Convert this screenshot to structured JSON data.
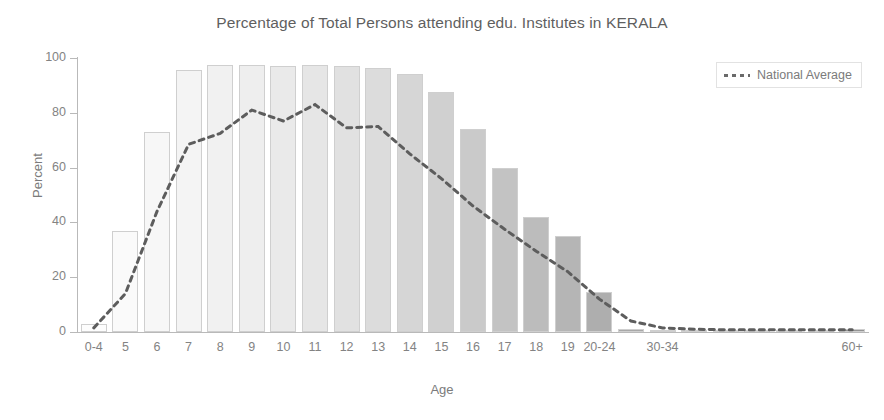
{
  "chart_data": {
    "type": "bar",
    "title": "Percentage of Total Persons attending edu. Institutes in KERALA",
    "xlabel": "Age",
    "ylabel": "Percent",
    "ylim": [
      0,
      100
    ],
    "xlim_note": "categorical age groups, left to right",
    "grid": false,
    "legend_position": "top-right",
    "ytick_labels": [
      "0",
      "20",
      "40",
      "60",
      "80",
      "100"
    ],
    "ytick_values": [
      0,
      20,
      40,
      60,
      80,
      100
    ],
    "categories": [
      "0-4",
      "5",
      "6",
      "7",
      "8",
      "9",
      "10",
      "11",
      "12",
      "13",
      "14",
      "15",
      "16",
      "17",
      "18",
      "19",
      "20-24",
      "25-29",
      "30-34",
      "35-39",
      "40-44",
      "45-49",
      "50-54",
      "55-59",
      "60+"
    ],
    "visible_xtick_labels": [
      "0-4",
      "5",
      "6",
      "7",
      "8",
      "9",
      "10",
      "11",
      "12",
      "13",
      "14",
      "15",
      "16",
      "17",
      "18",
      "19",
      "20-24",
      "",
      "30-34",
      "",
      "",
      "",
      "",
      "",
      "60+"
    ],
    "series": [
      {
        "name": "KERALA",
        "render": "bar",
        "values": [
          3,
          37,
          73,
          95.5,
          97.5,
          97.5,
          97,
          97.5,
          97,
          96.5,
          94,
          87.5,
          74,
          60,
          42,
          35,
          14.5,
          1.2,
          0.8,
          0.6,
          0.5,
          0.5,
          0.5,
          0.5,
          1.0
        ],
        "colors": [
          "#fdfdfd",
          "#fafafa",
          "#f7f7f7",
          "#f4f4f4",
          "#f1f1f1",
          "#eeeeee",
          "#eaeaea",
          "#e6e6e6",
          "#e1e1e1",
          "#dcdcdc",
          "#d6d6d6",
          "#d0d0d0",
          "#cacaca",
          "#c3c3c3",
          "#bcbcbc",
          "#b5b5b5",
          "#aeaeae",
          "#a8a8a8",
          "#a3a3a3",
          "#9f9f9f",
          "#9c9c9c",
          "#999999",
          "#979797",
          "#959595",
          "#939393"
        ],
        "border_color": "#cfcfcf"
      },
      {
        "name": "National Average",
        "render": "dashed-line",
        "color": "#5d5d5d",
        "values": [
          1.5,
          14,
          44,
          68.5,
          72.5,
          81,
          77,
          83,
          74.5,
          75,
          65,
          56,
          46,
          37.5,
          29.5,
          22,
          12,
          4,
          1.5,
          1,
          0.8,
          0.8,
          0.8,
          0.8,
          0.8
        ]
      }
    ],
    "legend": [
      {
        "label": "National Average",
        "marker": "dashed-line",
        "color": "#5d5d5d"
      }
    ]
  },
  "axis": {
    "y_title": "Percent",
    "x_title": "Age"
  }
}
